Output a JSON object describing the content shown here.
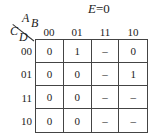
{
  "title": {
    "variable": "E",
    "equals": "=0"
  },
  "corner": {
    "column_vars": [
      "A",
      "B"
    ],
    "row_vars": [
      "C",
      "D"
    ]
  },
  "column_headers": [
    "00",
    "01",
    "11",
    "10"
  ],
  "row_headers": [
    "00",
    "01",
    "11",
    "10"
  ],
  "cells": [
    [
      "0",
      "1",
      "–",
      "0"
    ],
    [
      "0",
      "0",
      "–",
      "1"
    ],
    [
      "0",
      "0",
      "–",
      "–"
    ],
    [
      "0",
      "0",
      "–",
      "–"
    ]
  ]
}
